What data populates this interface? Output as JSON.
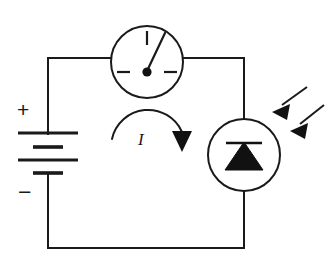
{
  "figure": {
    "kind": "circuit-schematic",
    "background_color": "#ffffff",
    "line_color": "#1a1a1a",
    "width": 334,
    "height": 268
  },
  "labels": {
    "positive_terminal": "+",
    "negative_terminal": "−",
    "current": "I"
  },
  "components": {
    "battery": {
      "name": "battery",
      "terminal_top": "+",
      "terminal_bottom": "−",
      "cell_count": 2,
      "plate_count": 4
    },
    "meter": {
      "name": "ammeter",
      "shape": "circle",
      "tick_positions": [
        "top",
        "left",
        "right"
      ],
      "needle_direction": "up-right",
      "needle_angle_deg": 22
    },
    "photodiode": {
      "name": "photodiode",
      "shape": "circle",
      "triangle_direction": "up",
      "cathode_bar": "horizontal"
    },
    "light_rays": {
      "name": "incident-light",
      "count": 2,
      "direction": "down-left"
    },
    "current_arrow": {
      "name": "current-direction",
      "path": "clockwise-arc",
      "head_direction": "down",
      "label": "I"
    }
  },
  "geometry": {
    "loop": {
      "left": 48,
      "right": 244,
      "top": 58,
      "bottom": 248
    },
    "meter": {
      "cx": 147,
      "cy": 62,
      "r": 36
    },
    "diode": {
      "cx": 244,
      "cy": 155,
      "r": 36
    }
  }
}
